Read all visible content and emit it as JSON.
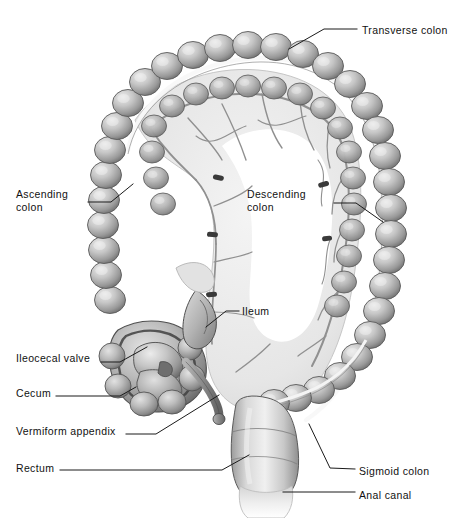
{
  "figure": {
    "style": "grayscale medical illustration, anterior view",
    "background_color": "#ffffff",
    "ink_color": "#111111"
  },
  "palette": {
    "outline": "#3b3b3b",
    "haustra_light": "#e7e7e7",
    "haustra_mid": "#b9b9b9",
    "haustra_dark": "#7e7e7e",
    "haustra_shadow": "#5d5d5d",
    "taenia_white": "#f7f7f7",
    "mesentery": "#ededed",
    "mesentery_edge": "#cfcfcf",
    "vessel": "#8a8a8a",
    "vessel_dark": "#6a6a6a",
    "rectum_light": "#f2f2f2",
    "leader_line": "#1a1a1a"
  },
  "labels": [
    {
      "id": "transverse-colon",
      "text": "Transverse colon",
      "x": 362,
      "y": 24,
      "align": "left",
      "leader": "M 289 49 L 324 29 L 357 29"
    },
    {
      "id": "ascending-colon",
      "text": "Ascending\ncolon",
      "x": 16,
      "y": 188,
      "align": "left",
      "leader": "M 88 202 L 111 202 L 133 184"
    },
    {
      "id": "descending-colon",
      "text": "Descending\ncolon",
      "x": 247,
      "y": 188,
      "align": "left",
      "leader": "M 334 203 L 356 203 L 383 222"
    },
    {
      "id": "ileum",
      "text": "Ileum",
      "x": 242,
      "y": 305,
      "align": "left",
      "leader": "M 206 327 L 226 311 L 239 311"
    },
    {
      "id": "ileocecal-valve",
      "text": "Ileocecal valve",
      "x": 16,
      "y": 352,
      "align": "left",
      "leader": "M 101 362 L 120 362 L 147 347"
    },
    {
      "id": "cecum",
      "text": "Cecum",
      "x": 16,
      "y": 387,
      "align": "left",
      "leader": "M 56 396 L 120 396 L 136 387"
    },
    {
      "id": "vermiform-appendix",
      "text": "Vermiform appendix",
      "x": 16,
      "y": 425,
      "align": "left",
      "leader": "M 126 434 L 156 434 L 219 395"
    },
    {
      "id": "rectum",
      "text": "Rectum",
      "x": 16,
      "y": 462,
      "align": "left",
      "leader": "M 60 470 L 222 470 L 249 455"
    },
    {
      "id": "sigmoid-colon",
      "text": "Sigmoid colon",
      "x": 359,
      "y": 465,
      "align": "left",
      "leader": "M 309 424 L 330 468 L 355 469"
    },
    {
      "id": "anal-canal",
      "text": "Anal canal",
      "x": 359,
      "y": 489,
      "align": "left",
      "leader": "M 283 492 L 355 492"
    }
  ],
  "structures": [
    {
      "id": "transverse-colon",
      "name": "Transverse colon",
      "description": "haustrated tube running horizontally across the top of the figure"
    },
    {
      "id": "ascending-colon",
      "name": "Ascending colon",
      "description": "haustrated tube running vertically on the left side"
    },
    {
      "id": "descending-colon",
      "name": "Descending colon",
      "description": "haustrated tube running vertically on the right side"
    },
    {
      "id": "sigmoid-colon",
      "name": "Sigmoid colon",
      "description": "S-shaped haustrated segment at lower right leading to the rectum"
    },
    {
      "id": "rectum",
      "name": "Rectum",
      "description": "smooth wide tube at bottom center"
    },
    {
      "id": "anal-canal",
      "name": "Anal canal",
      "description": "short terminal segment below the rectum"
    },
    {
      "id": "cecum",
      "name": "Cecum",
      "description": "rounded pouch at lower left of the ascending colon"
    },
    {
      "id": "ileocecal-valve",
      "name": "Ileocecal valve",
      "description": "opening between ileum and cecum, shown cut open"
    },
    {
      "id": "ileum",
      "name": "Ileum",
      "description": "terminal small intestine entering the cecum"
    },
    {
      "id": "vermiform-appendix",
      "name": "Vermiform appendix",
      "description": "narrow blind tube hanging from the cecum"
    },
    {
      "id": "mesentery",
      "name": "Mesentery",
      "description": "pale membrane with vascular arcades inside the colon frame"
    }
  ]
}
